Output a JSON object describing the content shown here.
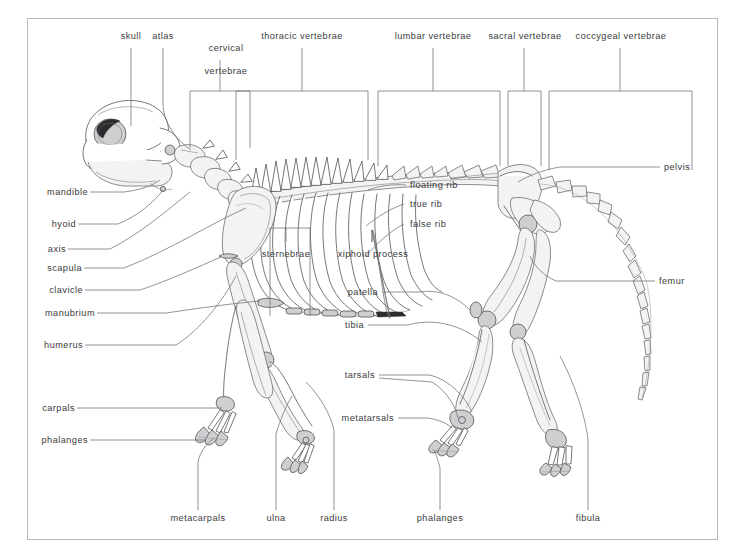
{
  "figure": {
    "frame_color": "#b9b9b9",
    "label_color": "#3a3a3c",
    "leader_color": "#6f6f73"
  },
  "top_labels": [
    {
      "id": "skull",
      "text": "skull"
    },
    {
      "id": "atlas",
      "text": "atlas"
    },
    {
      "id": "cervical-vertebrae",
      "text": "cervical",
      "text2": "vertebrae"
    },
    {
      "id": "thoracic-vertebrae",
      "text": "thoracic vertebrae"
    },
    {
      "id": "lumbar-vertebrae",
      "text": "lumbar vertebrae"
    },
    {
      "id": "sacral-vertebrae",
      "text": "sacral vertebrae"
    },
    {
      "id": "coccygeal-vertebrae",
      "text": "coccygeal vertebrae"
    }
  ],
  "left_labels": [
    {
      "id": "mandible",
      "text": "mandible"
    },
    {
      "id": "hyoid",
      "text": "hyoid"
    },
    {
      "id": "axis",
      "text": "axis"
    },
    {
      "id": "scapula",
      "text": "scapula"
    },
    {
      "id": "clavicle",
      "text": "clavicle"
    },
    {
      "id": "manubrium",
      "text": "manubrium"
    },
    {
      "id": "humerus",
      "text": "humerus"
    },
    {
      "id": "carpals",
      "text": "carpals"
    },
    {
      "id": "phalanges",
      "text": "phalanges"
    }
  ],
  "center_labels": [
    {
      "id": "floating-rib",
      "text": "floating rib"
    },
    {
      "id": "true-rib",
      "text": "true rib"
    },
    {
      "id": "false-rib",
      "text": "false rib"
    },
    {
      "id": "sternebrae",
      "text": "sternebrae"
    },
    {
      "id": "xiphoid-process",
      "text": "xiphoid process"
    },
    {
      "id": "patella",
      "text": "patella"
    },
    {
      "id": "tibia",
      "text": "tibia"
    },
    {
      "id": "tarsals",
      "text": "tarsals"
    },
    {
      "id": "metatarsals",
      "text": "metatarsals"
    }
  ],
  "right_labels": [
    {
      "id": "pelvis",
      "text": "pelvis"
    },
    {
      "id": "femur",
      "text": "femur"
    }
  ],
  "bottom_labels": [
    {
      "id": "metacarpals",
      "text": "metacarpals"
    },
    {
      "id": "ulna",
      "text": "ulna"
    },
    {
      "id": "radius",
      "text": "radius"
    },
    {
      "id": "phalanges",
      "text": "phalanges"
    },
    {
      "id": "fibula",
      "text": "fibula"
    }
  ]
}
